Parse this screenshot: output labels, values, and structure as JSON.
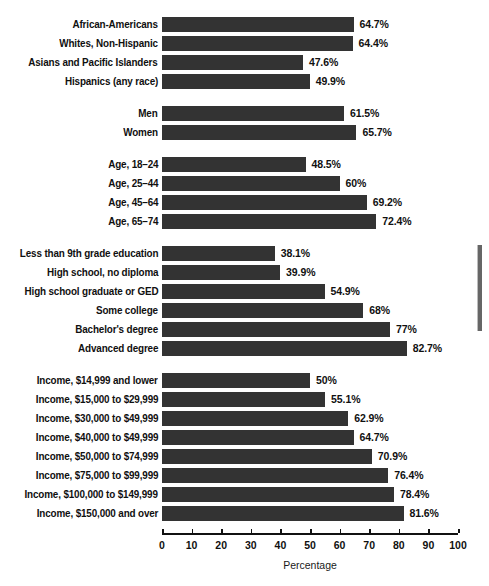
{
  "chart_data": {
    "type": "bar",
    "orientation": "horizontal",
    "title": "",
    "xlabel": "Percentage",
    "ylabel": "",
    "xlim": [
      0,
      100
    ],
    "xticks": [
      "0",
      "10",
      "20",
      "30",
      "40",
      "50",
      "60",
      "70",
      "80",
      "90",
      "100"
    ],
    "grid": false,
    "legend": null,
    "bar_color": "#333333",
    "categories": [
      "African-Americans",
      "Whites, Non-Hispanic",
      "Asians and Pacific Islanders",
      "Hispanics (any race)",
      "Men",
      "Women",
      "Age, 18–24",
      "Age, 25–44",
      "Age, 45–64",
      "Age, 65–74",
      "Less than 9th grade education",
      "High school, no diploma",
      "High school graduate or GED",
      "Some college",
      "Bachelor's degree",
      "Advanced degree",
      "Income, $14,999 and lower",
      "Income, $15,000 to $29,999",
      "Income, $30,000 to $49,999",
      "Income, $40,000 to $49,999",
      "Income, $50,000 to $74,999",
      "Income, $75,000 to $99,999",
      "Income, $100,000 to $149,999",
      "Income, $150,000 and over"
    ],
    "values": [
      64.7,
      64.4,
      47.6,
      49.9,
      61.5,
      65.7,
      48.5,
      60,
      69.2,
      72.4,
      38.1,
      39.9,
      54.9,
      68,
      77,
      82.7,
      50,
      55.1,
      62.9,
      64.7,
      70.9,
      76.4,
      78.4,
      81.6
    ],
    "value_labels": [
      "64.7%",
      "64.4%",
      "47.6%",
      "49.9%",
      "61.5%",
      "65.7%",
      "48.5%",
      "60%",
      "69.2%",
      "72.4%",
      "38.1%",
      "39.9%",
      "54.9%",
      "68%",
      "77%",
      "82.7%",
      "50%",
      "55.1%",
      "62.9%",
      "64.7%",
      "70.9%",
      "76.4%",
      "78.4%",
      "81.6%"
    ],
    "groups": [
      {
        "name": "race-ethnicity",
        "start": 0,
        "count": 4
      },
      {
        "name": "sex",
        "start": 4,
        "count": 2
      },
      {
        "name": "age",
        "start": 6,
        "count": 4
      },
      {
        "name": "education",
        "start": 10,
        "count": 6
      },
      {
        "name": "income",
        "start": 16,
        "count": 8
      }
    ]
  },
  "scrollbar": {
    "present": true,
    "orientation": "vertical",
    "position": "right"
  }
}
